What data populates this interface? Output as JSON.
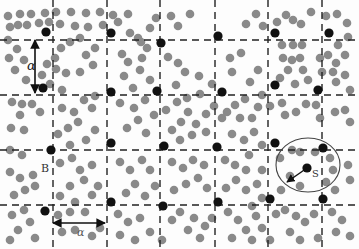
{
  "figure": {
    "width": 359,
    "height": 249,
    "background": "#fdfdfd",
    "particle_color": "#8a8a8a",
    "lattice_color": "#111111",
    "line_color": "#222222",
    "grid": {
      "vertical_x": [
        53,
        107,
        160,
        215,
        268,
        322
      ],
      "horizontal_y": [
        40,
        95,
        150,
        205
      ]
    },
    "labels": {
      "alpha": "α",
      "period_bottom": "α",
      "lattice_point": "B",
      "radius": "S"
    },
    "alpha_arrow": {
      "x": 35,
      "y1": 40,
      "y2": 93,
      "label_x": 27,
      "label_y": 70
    },
    "period_arrow": {
      "y": 223,
      "x1": 53,
      "x2": 105,
      "label_x": 77,
      "label_y": 236
    },
    "b_label": {
      "x": 41,
      "y": 172
    },
    "circle": {
      "cx": 308,
      "cy": 165,
      "rx": 32,
      "ry": 27
    },
    "radius_arrow": {
      "x1": 307,
      "y1": 168,
      "x2": 287,
      "y2": 182,
      "label_x": 312,
      "label_y": 177
    },
    "lattice_points": [
      [
        46,
        32
      ],
      [
        111,
        33
      ],
      [
        161,
        43
      ],
      [
        218,
        36
      ],
      [
        275,
        33
      ],
      [
        329,
        33
      ],
      [
        43,
        88
      ],
      [
        111,
        92
      ],
      [
        157,
        91
      ],
      [
        222,
        92
      ],
      [
        275,
        85
      ],
      [
        318,
        90
      ],
      [
        51,
        150
      ],
      [
        111,
        143
      ],
      [
        164,
        146
      ],
      [
        217,
        147
      ],
      [
        275,
        143
      ],
      [
        323,
        148
      ],
      [
        45,
        211
      ],
      [
        111,
        202
      ],
      [
        163,
        206
      ],
      [
        218,
        202
      ],
      [
        270,
        199
      ],
      [
        323,
        199
      ],
      [
        307,
        168
      ]
    ],
    "particles": [
      [
        8,
        16
      ],
      [
        20,
        14
      ],
      [
        31,
        14
      ],
      [
        45,
        13
      ],
      [
        56,
        12
      ],
      [
        71,
        12
      ],
      [
        86,
        13
      ],
      [
        100,
        12
      ],
      [
        113,
        15
      ],
      [
        128,
        14
      ],
      [
        10,
        27
      ],
      [
        18,
        25
      ],
      [
        27,
        25
      ],
      [
        39,
        23
      ],
      [
        49,
        22
      ],
      [
        60,
        24
      ],
      [
        75,
        26
      ],
      [
        88,
        27
      ],
      [
        103,
        25
      ],
      [
        118,
        22
      ],
      [
        8,
        40
      ],
      [
        17,
        49
      ],
      [
        9,
        58
      ],
      [
        24,
        60
      ],
      [
        15,
        70
      ],
      [
        26,
        80
      ],
      [
        42,
        75
      ],
      [
        47,
        64
      ],
      [
        55,
        58
      ],
      [
        61,
        48
      ],
      [
        56,
        69
      ],
      [
        66,
        73
      ],
      [
        50,
        84
      ],
      [
        62,
        90
      ],
      [
        70,
        42
      ],
      [
        80,
        38
      ],
      [
        86,
        55
      ],
      [
        95,
        48
      ],
      [
        93,
        65
      ],
      [
        80,
        72
      ],
      [
        128,
        62
      ],
      [
        142,
        58
      ],
      [
        147,
        48
      ],
      [
        138,
        38
      ],
      [
        150,
        28
      ],
      [
        156,
        18
      ],
      [
        171,
        16
      ],
      [
        178,
        26
      ],
      [
        190,
        14
      ],
      [
        130,
        33
      ],
      [
        141,
        42
      ],
      [
        122,
        54
      ],
      [
        140,
        70
      ],
      [
        150,
        80
      ],
      [
        133,
        88
      ],
      [
        124,
        76
      ],
      [
        168,
        57
      ],
      [
        178,
        63
      ],
      [
        185,
        72
      ],
      [
        176,
        85
      ],
      [
        187,
        98
      ],
      [
        200,
        94
      ],
      [
        212,
        84
      ],
      [
        199,
        76
      ],
      [
        230,
        58
      ],
      [
        241,
        53
      ],
      [
        232,
        72
      ],
      [
        246,
        24
      ],
      [
        256,
        14
      ],
      [
        263,
        26
      ],
      [
        277,
        22
      ],
      [
        286,
        15
      ],
      [
        293,
        20
      ],
      [
        301,
        24
      ],
      [
        311,
        12
      ],
      [
        326,
        16
      ],
      [
        337,
        14
      ],
      [
        347,
        23
      ],
      [
        348,
        37
      ],
      [
        338,
        45
      ],
      [
        345,
        55
      ],
      [
        336,
        63
      ],
      [
        345,
        75
      ],
      [
        336,
        82
      ],
      [
        350,
        90
      ],
      [
        282,
        45
      ],
      [
        293,
        45
      ],
      [
        302,
        45
      ],
      [
        300,
        58
      ],
      [
        292,
        60
      ],
      [
        283,
        58
      ],
      [
        303,
        70
      ],
      [
        288,
        70
      ],
      [
        280,
        78
      ],
      [
        295,
        84
      ],
      [
        308,
        80
      ],
      [
        322,
        72
      ],
      [
        320,
        58
      ],
      [
        328,
        55
      ],
      [
        333,
        72
      ],
      [
        258,
        70
      ],
      [
        250,
        82
      ],
      [
        262,
        95
      ],
      [
        245,
        99
      ],
      [
        235,
        105
      ],
      [
        227,
        112
      ],
      [
        240,
        118
      ],
      [
        252,
        118
      ],
      [
        258,
        107
      ],
      [
        270,
        106
      ],
      [
        282,
        103
      ],
      [
        285,
        115
      ],
      [
        296,
        112
      ],
      [
        306,
        104
      ],
      [
        316,
        105
      ],
      [
        320,
        118
      ],
      [
        335,
        112
      ],
      [
        345,
        110
      ],
      [
        350,
        122
      ],
      [
        12,
        102
      ],
      [
        22,
        104
      ],
      [
        32,
        104
      ],
      [
        20,
        115
      ],
      [
        11,
        128
      ],
      [
        24,
        130
      ],
      [
        40,
        112
      ],
      [
        62,
        108
      ],
      [
        74,
        112
      ],
      [
        84,
        100
      ],
      [
        95,
        96
      ],
      [
        92,
        108
      ],
      [
        78,
        122
      ],
      [
        68,
        128
      ],
      [
        58,
        134
      ],
      [
        70,
        145
      ],
      [
        86,
        140
      ],
      [
        95,
        130
      ],
      [
        120,
        103
      ],
      [
        134,
        108
      ],
      [
        145,
        100
      ],
      [
        138,
        120
      ],
      [
        127,
        128
      ],
      [
        146,
        133
      ],
      [
        154,
        115
      ],
      [
        166,
        110
      ],
      [
        177,
        102
      ],
      [
        188,
        112
      ],
      [
        181,
        122
      ],
      [
        196,
        124
      ],
      [
        206,
        114
      ],
      [
        214,
        106
      ],
      [
        222,
        118
      ],
      [
        206,
        132
      ],
      [
        192,
        135
      ],
      [
        180,
        140
      ],
      [
        172,
        130
      ],
      [
        232,
        134
      ],
      [
        244,
        140
      ],
      [
        254,
        132
      ],
      [
        262,
        145
      ],
      [
        249,
        155
      ],
      [
        10,
        150
      ],
      [
        22,
        155
      ],
      [
        10,
        172
      ],
      [
        20,
        178
      ],
      [
        25,
        190
      ],
      [
        14,
        195
      ],
      [
        35,
        186
      ],
      [
        33,
        175
      ],
      [
        60,
        163
      ],
      [
        72,
        158
      ],
      [
        80,
        170
      ],
      [
        92,
        165
      ],
      [
        84,
        180
      ],
      [
        70,
        186
      ],
      [
        60,
        196
      ],
      [
        75,
        202
      ],
      [
        92,
        195
      ],
      [
        98,
        186
      ],
      [
        120,
        162
      ],
      [
        130,
        170
      ],
      [
        142,
        160
      ],
      [
        150,
        170
      ],
      [
        135,
        184
      ],
      [
        126,
        193
      ],
      [
        145,
        196
      ],
      [
        155,
        186
      ],
      [
        172,
        162
      ],
      [
        183,
        168
      ],
      [
        193,
        160
      ],
      [
        204,
        165
      ],
      [
        198,
        178
      ],
      [
        186,
        184
      ],
      [
        174,
        190
      ],
      [
        207,
        188
      ],
      [
        225,
        160
      ],
      [
        235,
        165
      ],
      [
        246,
        170
      ],
      [
        236,
        180
      ],
      [
        226,
        188
      ],
      [
        246,
        190
      ],
      [
        257,
        184
      ],
      [
        262,
        170
      ],
      [
        280,
        158
      ],
      [
        292,
        150
      ],
      [
        300,
        152
      ],
      [
        315,
        152
      ],
      [
        330,
        158
      ],
      [
        333,
        170
      ],
      [
        326,
        182
      ],
      [
        335,
        190
      ],
      [
        348,
        165
      ],
      [
        350,
        180
      ],
      [
        300,
        186
      ],
      [
        290,
        176
      ],
      [
        281,
        190
      ],
      [
        262,
        198
      ],
      [
        252,
        206
      ],
      [
        12,
        215
      ],
      [
        24,
        210
      ],
      [
        30,
        222
      ],
      [
        18,
        230
      ],
      [
        10,
        240
      ],
      [
        35,
        238
      ],
      [
        58,
        215
      ],
      [
        70,
        212
      ],
      [
        85,
        212
      ],
      [
        62,
        232
      ],
      [
        75,
        230
      ],
      [
        92,
        236
      ],
      [
        100,
        228
      ],
      [
        118,
        214
      ],
      [
        128,
        222
      ],
      [
        140,
        218
      ],
      [
        120,
        235
      ],
      [
        135,
        240
      ],
      [
        150,
        232
      ],
      [
        162,
        240
      ],
      [
        172,
        220
      ],
      [
        180,
        212
      ],
      [
        194,
        218
      ],
      [
        188,
        230
      ],
      [
        205,
        226
      ],
      [
        200,
        238
      ],
      [
        212,
        218
      ],
      [
        228,
        212
      ],
      [
        238,
        220
      ],
      [
        246,
        230
      ],
      [
        232,
        238
      ],
      [
        256,
        216
      ],
      [
        262,
        228
      ],
      [
        276,
        214
      ],
      [
        285,
        210
      ],
      [
        296,
        216
      ],
      [
        305,
        222
      ],
      [
        290,
        232
      ],
      [
        300,
        240
      ],
      [
        314,
        214
      ],
      [
        332,
        212
      ],
      [
        342,
        220
      ],
      [
        336,
        232
      ],
      [
        350,
        236
      ],
      [
        318,
        238
      ],
      [
        270,
        240
      ],
      [
        252,
        240
      ]
    ]
  }
}
